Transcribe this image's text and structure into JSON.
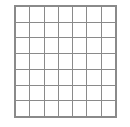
{
  "figure": {
    "kind": "grid-diagram",
    "rows": 7,
    "columns": 7,
    "background_color": "#ffffff",
    "gridline_color": "#8a8a8a",
    "hatch_color": "#787878",
    "filled_color": "#111111",
    "legend": {
      "empty_label": "empty cell",
      "hatched_label": "shaded cell",
      "filled_label": "filled cell"
    }
  },
  "chart_data": {
    "type": "heatmap",
    "xlabel": "",
    "ylabel": "",
    "categories_x": [
      "1",
      "2",
      "3",
      "4",
      "5",
      "6",
      "7"
    ],
    "categories_y": [
      "1",
      "2",
      "3",
      "4",
      "5",
      "6",
      "7"
    ],
    "state_legend": {
      "0": "empty",
      "1": "hatched",
      "2": "filled"
    },
    "grid": true,
    "legend_position": "none",
    "values": [
      [
        0,
        0,
        0,
        0,
        0,
        0,
        0
      ],
      [
        0,
        1,
        1,
        1,
        1,
        1,
        0
      ],
      [
        0,
        1,
        1,
        1,
        1,
        1,
        0
      ],
      [
        0,
        1,
        1,
        2,
        1,
        1,
        0
      ],
      [
        0,
        1,
        1,
        1,
        1,
        1,
        0
      ],
      [
        0,
        1,
        1,
        1,
        1,
        1,
        0
      ],
      [
        0,
        0,
        0,
        0,
        0,
        0,
        0
      ]
    ],
    "filled_cell": {
      "row": 4,
      "column": 4
    },
    "hatched_region": {
      "row_start": 2,
      "row_end": 6,
      "column_start": 2,
      "column_end": 6
    }
  }
}
